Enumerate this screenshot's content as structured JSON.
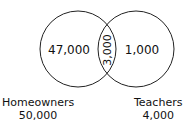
{
  "diagram": {
    "type": "venn",
    "sets": [
      {
        "name": "Homeowners",
        "total": "50,000",
        "only": "47,000"
      },
      {
        "name": "Teachers",
        "total": "4,000",
        "only": "1,000"
      }
    ],
    "intersection": "3,000",
    "stroke_color": "#222222"
  }
}
